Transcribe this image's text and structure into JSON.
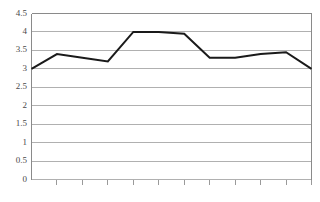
{
  "chart_data": {
    "type": "line",
    "title": "",
    "subtitle": "",
    "xlabel": "",
    "ylabel": "",
    "categories": [
      "1",
      "2",
      "3",
      "4",
      "5",
      "6",
      "7",
      "8",
      "9",
      "10",
      "11",
      "12"
    ],
    "values": [
      3.0,
      3.4,
      3.3,
      3.2,
      4.0,
      4.0,
      3.95,
      3.3,
      3.3,
      3.4,
      3.45,
      3.0
    ],
    "series": [
      {
        "name": "series-1",
        "values": [
          3.0,
          3.4,
          3.3,
          3.2,
          4.0,
          4.0,
          3.95,
          3.3,
          3.3,
          3.4,
          3.45,
          3.0
        ]
      }
    ],
    "ylim": [
      0,
      4.5
    ],
    "ytick_labels": [
      "0",
      "0.5",
      "1",
      "1.5",
      "2",
      "2.5",
      "3",
      "3.5",
      "4",
      "4.5"
    ],
    "ytick_values": [
      0,
      0.5,
      1,
      1.5,
      2,
      2.5,
      3,
      3.5,
      4,
      4.5
    ],
    "xtick_labels": [],
    "xtick_count": 11,
    "grid": true,
    "grid_axis": "y",
    "legend": false,
    "legend_position": "none",
    "colors": {
      "line": "#1a1a1a",
      "grid": "#b0b0b0",
      "axis": "#8a8a8a",
      "tick": "#9a9a9a",
      "label": "#4a4a4a",
      "background": "#ffffff"
    }
  }
}
